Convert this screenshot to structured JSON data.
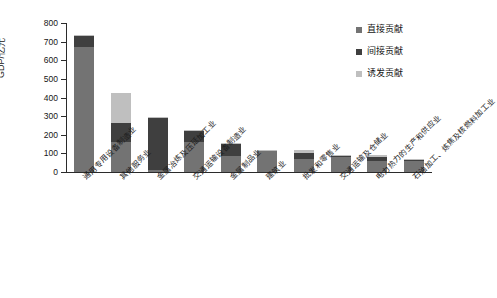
{
  "chart_data": {
    "type": "bar",
    "subtype": "stacked-vertical",
    "title": "",
    "xlabel": "",
    "ylabel": "GDP/亿元",
    "ylim": [
      0,
      800
    ],
    "yticks": [
      0,
      100,
      200,
      300,
      400,
      500,
      600,
      700,
      800
    ],
    "ytick_labels": [
      "0",
      "100",
      "200",
      "300",
      "400",
      "500",
      "600",
      "700",
      "800"
    ],
    "grid": false,
    "legend_position": "top-right",
    "stack_order_bottom_to_top": [
      "直接贡献",
      "间接贡献",
      "诱发贡献"
    ],
    "categories": [
      "通用专用设备制造业",
      "其他服务业",
      "金属冶炼及压延加工业",
      "交通运输设备制造业",
      "金属制品业",
      "建筑业",
      "批发和零售业",
      "交通运输及仓储业",
      "电力热力的生产和供应业",
      "石油加工、炼焦及核燃料加工业"
    ],
    "series": [
      {
        "name": "直接贡献",
        "color": "#737373",
        "values": [
          670,
          163,
          12,
          163,
          88,
          112,
          70,
          78,
          60,
          60
        ]
      },
      {
        "name": "间接贡献",
        "color": "#3f3f3f",
        "values": [
          65,
          100,
          278,
          57,
          63,
          4,
          30,
          8,
          20,
          7
        ]
      },
      {
        "name": "诱发贡献",
        "color": "#bfbfbf",
        "values": [
          2,
          162,
          3,
          4,
          4,
          4,
          18,
          6,
          10,
          3
        ]
      }
    ],
    "totals": [
      737,
      425,
      293,
      224,
      155,
      120,
      118,
      92,
      90,
      70
    ]
  },
  "axis": {
    "y_title": "GDP/亿元"
  },
  "legend": {
    "items": [
      {
        "label": "直接贡献",
        "color": "#737373"
      },
      {
        "label": "间接贡献",
        "color": "#3f3f3f"
      },
      {
        "label": "诱发贡献",
        "color": "#bfbfbf"
      }
    ]
  }
}
